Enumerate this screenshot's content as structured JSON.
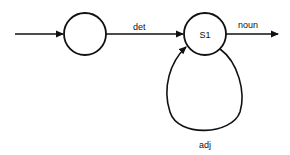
{
  "diagram": {
    "type": "finite-state-automaton",
    "states": [
      {
        "id": "start",
        "label": "",
        "cx": 85,
        "cy": 34,
        "r": 21
      },
      {
        "id": "S1",
        "label": "S1",
        "cx": 205,
        "cy": 34,
        "r": 21
      }
    ],
    "transitions": [
      {
        "from": "entry",
        "to": "start",
        "label": ""
      },
      {
        "from": "start",
        "to": "S1",
        "label": "det"
      },
      {
        "from": "S1",
        "to": "exit",
        "label": "noun"
      },
      {
        "from": "S1",
        "to": "S1",
        "label": "adj"
      }
    ],
    "colors": {
      "stroke": "#111111",
      "background": "#ffffff"
    }
  }
}
